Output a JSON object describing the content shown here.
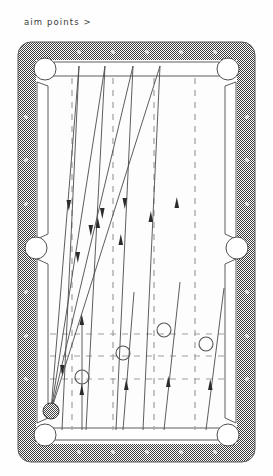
{
  "caption": {
    "text": "aim points >"
  },
  "colors": {
    "rail": "#8d8d8d",
    "rail_edge": "#4a4a4a",
    "cloth": "#fdfdfd",
    "cushion_line": "#555555",
    "pocket_fill": "#ffffff",
    "pocket_stroke": "#4f4f4f",
    "trajectory": "#4b4b4b",
    "dashed_grid": "#9a9a9a",
    "aim_circle": "#555555",
    "cue_ball": "#9a9a9a",
    "diamond": "#dcdcdc",
    "background": "#ffffff"
  },
  "diagram": {
    "type": "pool-table-aim-diagram",
    "title": "aim points",
    "table": {
      "outer": {
        "x": 18,
        "y": 42,
        "width": 237,
        "height": 420,
        "corner_radius": 13
      },
      "cloth": {
        "x": 36,
        "y": 60,
        "width": 201,
        "height": 384
      }
    },
    "pockets": [
      {
        "name": "top-left-corner",
        "cx": 45,
        "cy": 69,
        "r": 11
      },
      {
        "name": "top-right-corner",
        "cx": 228,
        "cy": 69,
        "r": 11
      },
      {
        "name": "left-side",
        "cx": 36,
        "cy": 248,
        "r": 11
      },
      {
        "name": "right-side",
        "cx": 237,
        "cy": 248,
        "r": 11
      },
      {
        "name": "bottom-left-corner",
        "cx": 45,
        "cy": 435,
        "r": 11
      },
      {
        "name": "bottom-right-corner",
        "cx": 228,
        "cy": 435,
        "r": 11
      }
    ],
    "rail_diamonds": {
      "top": [
        {
          "x": 79
        },
        {
          "x": 113
        },
        {
          "x": 147
        },
        {
          "x": 181
        },
        {
          "x": 215
        }
      ],
      "bottom": [
        {
          "x": 79
        },
        {
          "x": 113
        },
        {
          "x": 147
        },
        {
          "x": 181
        },
        {
          "x": 215
        }
      ],
      "left": [
        {
          "y": 117
        },
        {
          "y": 160
        },
        {
          "y": 204
        },
        {
          "y": 292
        },
        {
          "y": 336
        },
        {
          "y": 379
        }
      ],
      "right": [
        {
          "y": 117
        },
        {
          "y": 160
        },
        {
          "y": 204
        },
        {
          "y": 292
        },
        {
          "y": 336
        },
        {
          "y": 379
        }
      ]
    },
    "cue_ball": {
      "cx": 51,
      "cy": 411,
      "r": 8,
      "label": "cue-ball"
    },
    "aim_points": [
      {
        "id": 1,
        "cx": 82,
        "cy": 377,
        "r": 7
      },
      {
        "id": 2,
        "cx": 123,
        "cy": 353,
        "r": 7
      },
      {
        "id": 3,
        "cx": 164,
        "cy": 330,
        "r": 7
      },
      {
        "id": 4,
        "cx": 206,
        "cy": 344,
        "r": 7
      }
    ],
    "dashed_columns": [
      {
        "x": 72
      },
      {
        "x": 113
      },
      {
        "x": 154
      },
      {
        "x": 195
      }
    ],
    "dashed_rows": [
      {
        "y": 334
      },
      {
        "y": 356
      },
      {
        "y": 379
      }
    ],
    "outbound_paths": [
      {
        "name": "shot-1",
        "from": [
          51,
          411
        ],
        "to": [
          79,
          66
        ],
        "arrow_at": 0.62
      },
      {
        "name": "shot-2",
        "from": [
          51,
          411
        ],
        "to": [
          105,
          66
        ],
        "arrow_at": 0.6
      },
      {
        "name": "shot-3",
        "from": [
          51,
          411
        ],
        "to": [
          133,
          66
        ],
        "arrow_at": 0.58
      },
      {
        "name": "shot-4",
        "from": [
          51,
          411
        ],
        "to": [
          160,
          66
        ],
        "arrow_at": 0.56
      }
    ],
    "return_paths": [
      {
        "name": "return-1",
        "from": [
          79,
          66
        ],
        "to": [
          62,
          437
        ],
        "arrow_at": 0.4
      },
      {
        "name": "return-2",
        "from": [
          105,
          66
        ],
        "to": [
          84,
          437
        ],
        "arrow_at": 0.42
      },
      {
        "name": "return-3",
        "from": [
          133,
          66
        ],
        "to": [
          117,
          437
        ],
        "arrow_at": 0.44
      },
      {
        "name": "return-4",
        "from": [
          160,
          66
        ],
        "to": [
          143,
          437
        ],
        "arrow_at": 0.46
      }
    ],
    "ball_paths": [
      {
        "name": "ball-path-1",
        "from": [
          82,
          437
        ],
        "to": [
          82,
          330
        ],
        "arrow_at": 0.55
      },
      {
        "name": "ball-path-2",
        "from": [
          123,
          437
        ],
        "to": [
          131,
          300
        ],
        "arrow_at": 0.55
      },
      {
        "name": "ball-path-3",
        "from": [
          164,
          437
        ],
        "to": [
          178,
          290
        ],
        "arrow_at": 0.55
      },
      {
        "name": "ball-path-4",
        "from": [
          206,
          437
        ],
        "to": [
          221,
          296
        ],
        "arrow_at": 0.55
      }
    ]
  }
}
